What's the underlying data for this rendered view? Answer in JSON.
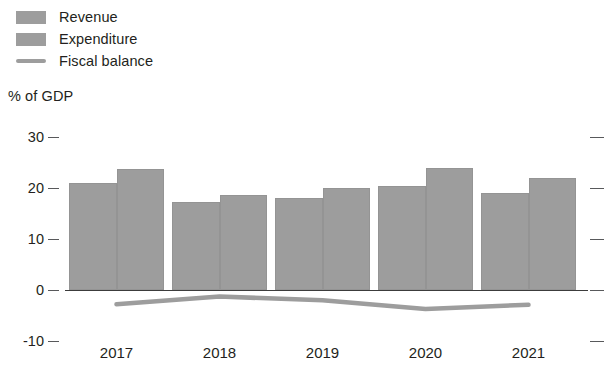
{
  "legend": {
    "items": [
      {
        "label": "Revenue",
        "marker": "bar-swatch",
        "color": "#9d9d9d"
      },
      {
        "label": "Expenditure",
        "marker": "bar-swatch",
        "color": "#9d9d9d"
      },
      {
        "label": "Fiscal balance",
        "marker": "line-swatch",
        "color": "#9d9d9d"
      }
    ]
  },
  "axis": {
    "unit_caption": "% of GDP",
    "y_ticks": [
      "30",
      "20",
      "10",
      "0",
      "-10"
    ],
    "x_ticks": [
      "2017",
      "2018",
      "2019",
      "2020",
      "2021"
    ]
  },
  "chart_data": {
    "type": "bar",
    "title": "",
    "subtitle": "",
    "xlabel": "",
    "ylabel": "% of GDP",
    "ylim": [
      -10,
      30
    ],
    "yticks": [
      -10,
      0,
      10,
      20,
      30
    ],
    "grid": false,
    "legend_position": "top-left",
    "categories": [
      "2017",
      "2018",
      "2019",
      "2020",
      "2021"
    ],
    "series": [
      {
        "name": "Revenue",
        "type": "bar",
        "color": "#9d9d9d",
        "values": [
          21.0,
          17.3,
          18.0,
          20.3,
          19.0
        ]
      },
      {
        "name": "Expenditure",
        "type": "bar",
        "color": "#9d9d9d",
        "values": [
          23.8,
          18.6,
          20.0,
          24.0,
          22.0
        ]
      },
      {
        "name": "Fiscal balance",
        "type": "line",
        "color": "#9d9d9d",
        "values": [
          -2.8,
          -1.3,
          -2.0,
          -3.7,
          -2.9
        ]
      }
    ]
  }
}
